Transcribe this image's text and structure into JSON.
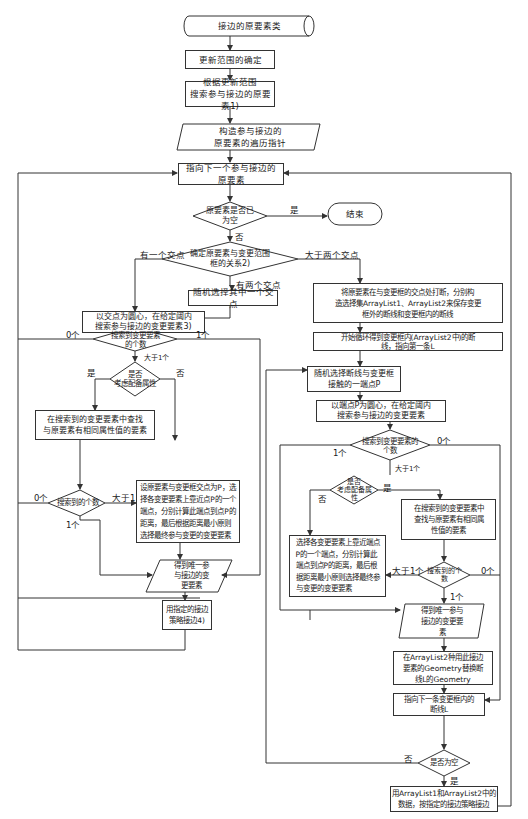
{
  "flowchart": {
    "nodes": {
      "start": "接边的原要素类",
      "update_range": "更新范围的确定",
      "search_elements": "根据更新范围\n搜索参与接边的原要素1)",
      "build_iterator": "构造参与接边的\n原要素的遍历指针",
      "next_element": "指向下一个参与接边的原要素",
      "is_empty": "原要素是否已\n为空",
      "end": "结束",
      "relation": "确定原要素与变更范围\n框的关系2)",
      "random_pick": "随机选择其中一个交点",
      "search_by_point": "以交点为圆心，在给定阈内\n搜索参与接边的变更要素3)",
      "count_changed": "搜索到变更要素\n的个数",
      "consider_attr": "是否\n考虑配备属性",
      "find_same_attr": "在搜索到的变更要素中查找\n与原要素有相同属性值的要素",
      "count_found": "搜索到的个数",
      "nearest_rule": "设原要素与变更框交点为P，选\n择各变更要素上靠近点P的一个\n端点，分别计算此端点到点P的\n距离，最后根据距离最小原则\n选择最终参与变更的变更要素",
      "unique_element": "得到唯一参\n与接边的变\n更要素",
      "edge_strategy": "用指定的接边\n策略接边4)",
      "split_lines": "将原要素在与变更框的交点处打断，分别构\n造选择集ArrayList1、ArrayList2来保存变更\n框外的断线和变更框内的断线",
      "loop_start": "开始循环得到变更框内(ArrayList2中)的断\n线，指向第一条L",
      "random_endpoint": "随机选择断线与变更框\n接触的一端点P",
      "search_by_endpoint": "以端点P为圆心，在给定阈内\n搜索参与接边的变更要素",
      "count_changed_r": "搜索到变更要素的\n个数",
      "consider_attr_r": "是否\n考虑配备属\n性",
      "find_same_attr_r": "在搜索到的变更要素中\n查找与原要素有相同属\n性值的要素",
      "nearest_rule_r": "选择各变更要素上靠近端点\nP的一个端点，分别计算此\n端点到点P的距离，最后根\n据距离最小原则选择最终参\n与变更的变更要素",
      "count_found_r": "搜索到的个\n数",
      "unique_element_r": "得到唯一参与\n接边的变更要\n素",
      "replace_geometry": "在ArrayList2种用此接边\n要素的Geometry替换断\n线L的Geometry",
      "next_line": "指向下一条变更框内的\n断线L",
      "is_empty_r": "是否为空",
      "final_merge": "用ArrayList1和ArrayList2中的\n数据，按指定的接边策略接边"
    },
    "edge_labels": {
      "yes": "是",
      "no": "否",
      "one_intersection": "有一个交点",
      "two_intersections": "有两个交点",
      "more_than_two": "大于两个交点",
      "zero": "0个",
      "one": "1个",
      "more_than_one": "大于1个",
      "more_than_1": "大于1"
    },
    "colors": {
      "line": "#333333",
      "background": "#ffffff"
    }
  }
}
